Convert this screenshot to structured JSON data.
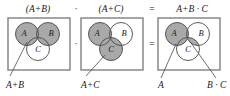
{
  "figure": {
    "title_formula": "(A+B) · (A+C) = A+B · C",
    "shade_color": "#a9a9a9",
    "outline_color": "#4a4a4a",
    "box_color": "#808080",
    "text_color": "#1a1a1a",
    "background": "#ffffff"
  },
  "top_row": {
    "term1": "(A+B)",
    "operator_dot": "·",
    "term2": "(A+C)",
    "equals": "=",
    "result_a": "A",
    "result_plus": "+",
    "result_b": "B",
    "result_dot": "·",
    "result_c": "C",
    "result_full": "A+B · C"
  },
  "middle_row": {
    "operator_dot": "·",
    "equals": "="
  },
  "panels": [
    {
      "id": "panel-1",
      "formula": "(A+B)",
      "circle_labels": {
        "a": "A",
        "b": "B",
        "c": "C"
      },
      "shaded_regions": [
        "A",
        "B"
      ],
      "callouts": [
        {
          "label": "A+B",
          "target": "union-of-A-and-B"
        }
      ]
    },
    {
      "id": "panel-2",
      "formula": "(A+C)",
      "circle_labels": {
        "a": "A",
        "b": "B",
        "c": "C"
      },
      "shaded_regions": [
        "A",
        "C"
      ],
      "callouts": [
        {
          "label": "A+C",
          "target": "union-of-A-and-C"
        }
      ]
    },
    {
      "id": "panel-3",
      "formula": "A+B · C",
      "circle_labels": {
        "a": "A",
        "b": "B",
        "c": "C"
      },
      "shaded_regions": [
        "A",
        "B∩C"
      ],
      "callouts": [
        {
          "label": "A",
          "target": "circle-A"
        },
        {
          "label": "B · C",
          "target": "intersection-of-B-and-C"
        }
      ]
    }
  ]
}
